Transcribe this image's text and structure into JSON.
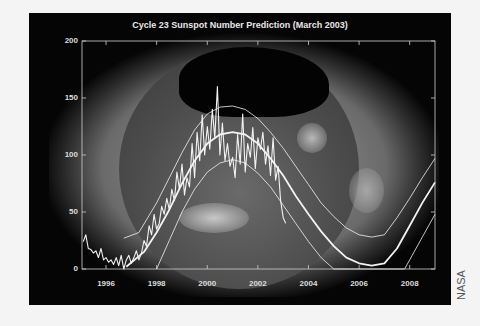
{
  "chart_data": {
    "type": "line",
    "title": "Cycle 23 Sunspot Number Prediction (March 2003)",
    "xlabel": "",
    "ylabel": "",
    "xlim": [
      1995.05,
      2009.0
    ],
    "ylim": [
      0,
      200
    ],
    "x_ticks": [
      "1996",
      "1998",
      "2000",
      "2002",
      "2004",
      "2006",
      "2008"
    ],
    "y_ticks": [
      "0",
      "50",
      "100",
      "150",
      "200"
    ],
    "grid": false,
    "background": "solar x-ray image",
    "series": [
      {
        "name": "Observed monthly sunspot number",
        "style": "jagged",
        "x": [
          1995.1,
          1995.2,
          1995.3,
          1995.4,
          1995.5,
          1995.6,
          1995.7,
          1995.8,
          1995.9,
          1996.0,
          1996.1,
          1996.2,
          1996.3,
          1996.4,
          1996.5,
          1996.6,
          1996.7,
          1996.8,
          1996.9,
          1997.0,
          1997.1,
          1997.2,
          1997.3,
          1997.4,
          1997.5,
          1997.6,
          1997.7,
          1997.8,
          1997.9,
          1998.0,
          1998.1,
          1998.2,
          1998.3,
          1998.4,
          1998.5,
          1998.6,
          1998.7,
          1998.8,
          1998.9,
          1999.0,
          1999.1,
          1999.2,
          1999.3,
          1999.4,
          1999.5,
          1999.6,
          1999.7,
          1999.8,
          1999.9,
          2000.0,
          2000.1,
          2000.2,
          2000.3,
          2000.4,
          2000.5,
          2000.6,
          2000.7,
          2000.8,
          2000.9,
          2001.0,
          2001.1,
          2001.2,
          2001.3,
          2001.4,
          2001.5,
          2001.6,
          2001.7,
          2001.8,
          2001.9,
          2002.0,
          2002.1,
          2002.2,
          2002.3,
          2002.4,
          2002.5,
          2002.6,
          2002.7,
          2002.8,
          2002.9,
          2003.0,
          2003.1
        ],
        "values": [
          24,
          30,
          18,
          17,
          14,
          16,
          10,
          18,
          8,
          10,
          6,
          8,
          4,
          10,
          3,
          12,
          0,
          8,
          12,
          5,
          10,
          16,
          8,
          14,
          25,
          20,
          38,
          30,
          48,
          35,
          40,
          55,
          48,
          62,
          52,
          70,
          60,
          85,
          70,
          92,
          65,
          80,
          72,
          110,
          80,
          120,
          95,
          135,
          100,
          125,
          105,
          140,
          115,
          160,
          100,
          128,
          95,
          110,
          90,
          98,
          80,
          118,
          92,
          136,
          85,
          110,
          98,
          124,
          88,
          115,
          105,
          120,
          92,
          108,
          82,
          115,
          78,
          90,
          60,
          45,
          40
        ]
      },
      {
        "name": "Predicted (mean)",
        "style": "smooth thick",
        "x": [
          1996.8,
          1997.5,
          1998.0,
          1998.5,
          1999.0,
          1999.5,
          2000.0,
          2000.5,
          2001.0,
          2001.5,
          2002.0,
          2002.5,
          2003.0,
          2003.5,
          2004.0,
          2004.5,
          2005.0,
          2005.5,
          2006.0,
          2006.5,
          2007.0,
          2007.5,
          2008.0,
          2008.5,
          2009.0
        ],
        "values": [
          2,
          15,
          32,
          52,
          75,
          95,
          110,
          118,
          120,
          118,
          110,
          97,
          82,
          64,
          48,
          33,
          20,
          10,
          5,
          3,
          5,
          18,
          38,
          58,
          76
        ]
      },
      {
        "name": "Upper bound",
        "style": "thin",
        "x": [
          1996.7,
          1997.3,
          1998.0,
          1998.5,
          1999.0,
          1999.5,
          2000.0,
          2000.5,
          2001.0,
          2001.5,
          2002.0,
          2002.5,
          2003.0,
          2003.5,
          2004.0,
          2004.5,
          2005.0,
          2005.5,
          2006.0,
          2006.5,
          2007.0,
          2007.5,
          2008.0,
          2008.5,
          2009.0
        ],
        "values": [
          27,
          32,
          58,
          80,
          102,
          122,
          136,
          142,
          143,
          140,
          132,
          120,
          106,
          90,
          74,
          58,
          46,
          36,
          30,
          28,
          30,
          45,
          62,
          80,
          97
        ]
      },
      {
        "name": "Lower bound",
        "style": "thin",
        "x": [
          1998.0,
          1998.5,
          1999.0,
          1999.5,
          2000.0,
          2000.5,
          2001.0,
          2001.5,
          2002.0,
          2002.5,
          2003.0,
          2003.5,
          2004.0,
          2004.5,
          2005.0,
          2007.8,
          2008.0,
          2008.5,
          2009.0
        ],
        "values": [
          0,
          25,
          50,
          70,
          85,
          93,
          96,
          93,
          84,
          72,
          56,
          40,
          24,
          10,
          0,
          0,
          8,
          28,
          48
        ]
      }
    ]
  },
  "credit": "NASA"
}
